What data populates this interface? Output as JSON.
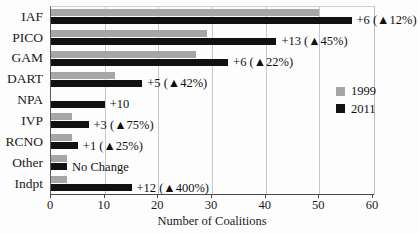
{
  "chart_data": {
    "type": "bar",
    "title": "",
    "subtitle": "",
    "xlabel": "Number of Coalitions",
    "ylabel": "",
    "xlim": [
      0,
      60
    ],
    "xticks": [
      0,
      10,
      20,
      30,
      40,
      50,
      60
    ],
    "xtick_labels": [
      "0",
      "10",
      "20",
      "30",
      "40",
      "50",
      "60"
    ],
    "grid": "vertical",
    "orientation": "horizontal",
    "legend_position": "right-middle",
    "categories": [
      "IAF",
      "PICO",
      "GAM",
      "DART",
      "NPA",
      "IVP",
      "RCNO",
      "Other",
      "Indpt"
    ],
    "series": [
      {
        "name": "1999",
        "color": "#a6a6a6",
        "values": [
          50,
          29,
          27,
          12,
          0,
          4,
          4,
          3,
          3
        ]
      },
      {
        "name": "2011",
        "color": "#111111",
        "values": [
          56,
          42,
          33,
          17,
          10,
          7,
          5,
          3,
          15
        ]
      }
    ],
    "annotations": [
      "+6 (▲12%)",
      "+13 (▲45%)",
      "+6 (▲22%)",
      "+5 (▲42%)",
      "+10",
      "+3 (▲75%)",
      "+1 (▲25%)",
      "No Change",
      "+12 (▲400%)"
    ]
  },
  "legend": {
    "items": [
      {
        "label": "1999",
        "color": "#a6a6a6"
      },
      {
        "label": "2011",
        "color": "#111111"
      }
    ]
  }
}
